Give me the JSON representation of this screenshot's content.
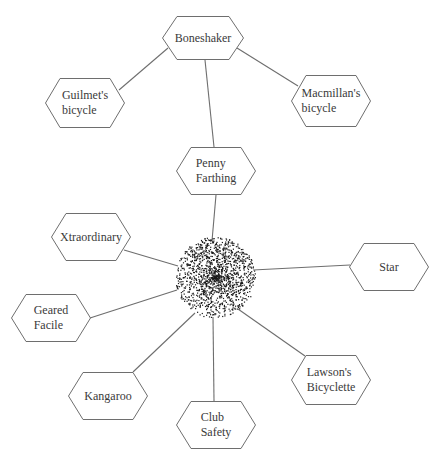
{
  "diagram": {
    "hub": {
      "label": "",
      "cx": 215,
      "cy": 277,
      "r": 40,
      "style": "stipple-cluster"
    },
    "nodes": [
      {
        "id": "boneshaker",
        "label": "Boneshaker",
        "cx": 203,
        "cy": 38,
        "w": 82,
        "h": 44
      },
      {
        "id": "guilmet",
        "label": "Guilmet's\nbicycle",
        "cx": 85,
        "cy": 103,
        "w": 80,
        "h": 50
      },
      {
        "id": "macmillan",
        "label": "Macmillan's\nbicycle",
        "cx": 331,
        "cy": 101,
        "w": 80,
        "h": 52
      },
      {
        "id": "penny-farthing",
        "label": "Penny\nFarthing",
        "cx": 216,
        "cy": 171,
        "w": 80,
        "h": 48
      },
      {
        "id": "xtraordinary",
        "label": "Xtraordinary",
        "cx": 91,
        "cy": 237,
        "w": 80,
        "h": 48
      },
      {
        "id": "geared-facile",
        "label": "Geared\nFacile",
        "cx": 51,
        "cy": 318,
        "w": 80,
        "h": 48
      },
      {
        "id": "star",
        "label": "Star",
        "cx": 389,
        "cy": 267,
        "w": 80,
        "h": 48
      },
      {
        "id": "lawson",
        "label": "Lawson's\nBicyclette",
        "cx": 331,
        "cy": 380,
        "w": 80,
        "h": 50
      },
      {
        "id": "kangaroo",
        "label": "Kangaroo",
        "cx": 108,
        "cy": 396,
        "w": 80,
        "h": 48
      },
      {
        "id": "club-safety",
        "label": "Club\nSafety",
        "cx": 216,
        "cy": 425,
        "w": 80,
        "h": 48
      }
    ],
    "edges": [
      {
        "from": "boneshaker",
        "to": "guilmet",
        "x1": 168,
        "y1": 48,
        "x2": 119,
        "y2": 90
      },
      {
        "from": "boneshaker",
        "to": "macmillan",
        "x1": 237,
        "y1": 48,
        "x2": 298,
        "y2": 86
      },
      {
        "from": "boneshaker",
        "to": "penny-farthing",
        "x1": 205,
        "y1": 60,
        "x2": 214,
        "y2": 147
      },
      {
        "from": "penny-farthing",
        "to": "hub",
        "x1": 216,
        "y1": 195,
        "x2": 212,
        "y2": 241
      },
      {
        "from": "xtraordinary",
        "to": "hub",
        "x1": 124,
        "y1": 250,
        "x2": 178,
        "y2": 266
      },
      {
        "from": "geared-facile",
        "to": "hub",
        "x1": 90,
        "y1": 318,
        "x2": 177,
        "y2": 290
      },
      {
        "from": "star",
        "to": "hub",
        "x1": 350,
        "y1": 265,
        "x2": 253,
        "y2": 270
      },
      {
        "from": "lawson",
        "to": "hub",
        "x1": 305,
        "y1": 356,
        "x2": 238,
        "y2": 309
      },
      {
        "from": "kangaroo",
        "to": "hub",
        "x1": 133,
        "y1": 372,
        "x2": 195,
        "y2": 313
      },
      {
        "from": "club-safety",
        "to": "hub",
        "x1": 214,
        "y1": 401,
        "x2": 213,
        "y2": 317
      }
    ],
    "colors": {
      "line": "#6e6e6e",
      "text": "#3a3a3a",
      "dots": "#1a1a1a",
      "background": "#ffffff"
    }
  }
}
